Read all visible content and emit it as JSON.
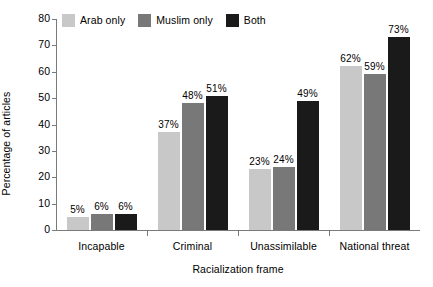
{
  "chart_data": {
    "type": "bar",
    "title": "",
    "subtitle": "",
    "xlabel": "Racialization frame",
    "ylabel": "Percentage of articles",
    "categories": [
      "Incapable",
      "Criminal",
      "Unassimilable",
      "National threat"
    ],
    "series": [
      {
        "name": "Arab only",
        "color": "#c8c8c8",
        "values": [
          5,
          37,
          23,
          62
        ],
        "labels": [
          "5%",
          "37%",
          "23%",
          "62%"
        ]
      },
      {
        "name": "Muslim only",
        "color": "#787878",
        "values": [
          6,
          48,
          24,
          59
        ],
        "labels": [
          "6%",
          "48%",
          "24%",
          "59%"
        ]
      },
      {
        "name": "Both",
        "color": "#1a1a1a",
        "values": [
          6,
          51,
          49,
          73
        ],
        "labels": [
          "6%",
          "51%",
          "49%",
          "73%"
        ]
      }
    ],
    "ylim": [
      0,
      80
    ],
    "yticks": [
      0,
      10,
      20,
      30,
      40,
      50,
      60,
      70,
      80
    ],
    "ytick_labels": [
      "0",
      "10",
      "20",
      "30",
      "40",
      "50",
      "60",
      "70",
      "80"
    ],
    "grid": false,
    "legend_position": "top-left",
    "value_labels_suffix": "%",
    "axis_color": "#7a7a7a",
    "text_color": "#000000",
    "background": "#ffffff"
  },
  "legend": {
    "items": [
      {
        "label": "Arab only",
        "color": "#c8c8c8"
      },
      {
        "label": "Muslim only",
        "color": "#787878"
      },
      {
        "label": "Both",
        "color": "#1a1a1a"
      }
    ]
  }
}
